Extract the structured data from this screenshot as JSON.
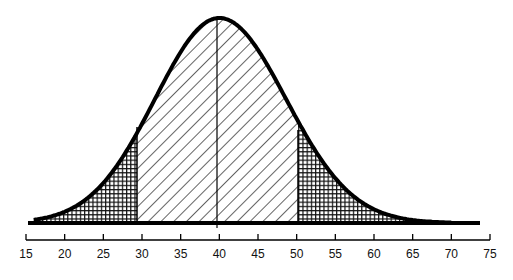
{
  "diagram": {
    "type": "normal-distribution-curve",
    "mean": 40,
    "shaded_regions": [
      {
        "name": "left-tail",
        "from": 16,
        "to": 29.5,
        "pattern": "crosshatch"
      },
      {
        "name": "center",
        "from": 29.5,
        "to": 50.5,
        "pattern": "diagonal-hatch"
      },
      {
        "name": "right-tail",
        "from": 50.5,
        "to": 67,
        "pattern": "crosshatch"
      }
    ],
    "colors": {
      "stroke": "#000000",
      "background": "#ffffff"
    }
  },
  "axis": {
    "min": 15,
    "max": 75,
    "ticks": [
      "15",
      "20",
      "25",
      "30",
      "35",
      "40",
      "45",
      "50",
      "55",
      "60",
      "65",
      "70",
      "75"
    ]
  }
}
